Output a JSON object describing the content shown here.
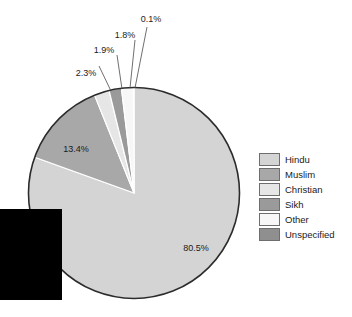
{
  "chart_data": {
    "type": "pie",
    "title": "",
    "subtitle": "",
    "xlabel": "",
    "ylabel": "",
    "legend_position": "right",
    "grid": false,
    "units": "percent",
    "categories": [
      "Hindu",
      "Muslim",
      "Christian",
      "Sikh",
      "Other",
      "Unspecified"
    ],
    "values": [
      80.5,
      13.4,
      2.3,
      1.9,
      1.8,
      0.1
    ],
    "data_labels": [
      "80.5%",
      "13.4%",
      "2.3%",
      "1.9%",
      "1.8%",
      "0.1%"
    ],
    "colors": [
      "#d4d4d4",
      "#a8a8a8",
      "#e6e6e6",
      "#9a9a9a",
      "#f7f7f7",
      "#8f8f8f"
    ],
    "slices": [
      {
        "name": "Hindu",
        "value": 80.5,
        "label": "80.5%",
        "color": "#d4d4d4"
      },
      {
        "name": "Muslim",
        "value": 13.4,
        "label": "13.4%",
        "color": "#a8a8a8"
      },
      {
        "name": "Christian",
        "value": 2.3,
        "label": "2.3%",
        "color": "#e6e6e6"
      },
      {
        "name": "Sikh",
        "value": 1.9,
        "label": "1.9%",
        "color": "#9a9a9a"
      },
      {
        "name": "Other",
        "value": 1.8,
        "label": "1.8%",
        "color": "#f7f7f7"
      },
      {
        "name": "Unspecified",
        "value": 0.1,
        "label": "0.1%",
        "color": "#8f8f8f"
      }
    ]
  },
  "legend": {
    "items": [
      {
        "label": "Hindu",
        "color": "#d4d4d4"
      },
      {
        "label": "Muslim",
        "color": "#a8a8a8"
      },
      {
        "label": "Christian",
        "color": "#e6e6e6"
      },
      {
        "label": "Sikh",
        "color": "#9a9a9a"
      },
      {
        "label": "Other",
        "color": "#f7f7f7"
      },
      {
        "label": "Unspecified",
        "color": "#8f8f8f"
      }
    ]
  },
  "labels": {
    "hindu_pct": "80.5%",
    "muslim_pct": "13.4%",
    "christian_pct": "2.3%",
    "sikh_pct": "1.9%",
    "other_pct": "1.8%",
    "unspecified_pct": "0.1%"
  }
}
